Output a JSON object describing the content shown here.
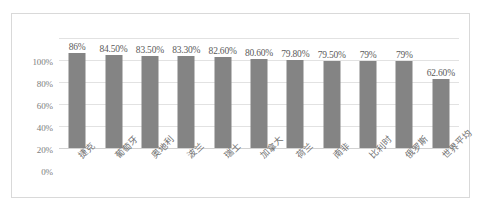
{
  "chart_data": {
    "type": "bar",
    "title": "",
    "subtitle": "",
    "xlabel": "",
    "ylabel": "",
    "ylim": [
      0,
      100
    ],
    "grid": true,
    "legend": false,
    "legend_position": "none",
    "bar_color": "#848484",
    "gridline_color": "#e2e2e2",
    "axis_text_color": "#7d7d7d",
    "categories": [
      "捷克",
      "葡萄牙",
      "奥地利",
      "波兰",
      "瑞士",
      "加拿大",
      "荷兰",
      "南非",
      "比利时",
      "俄罗斯",
      "世界平均"
    ],
    "values": [
      86,
      84.5,
      83.5,
      83.3,
      82.6,
      80.6,
      79.8,
      79.5,
      79,
      79,
      62.6
    ],
    "data_labels": [
      "86%",
      "84.50%",
      "83.50%",
      "83.30%",
      "82.60%",
      "80.60%",
      "79.80%",
      "79.50%",
      "79%",
      "79%",
      "62.60%"
    ],
    "y_ticks": [
      100,
      80,
      60,
      40,
      20,
      0
    ],
    "y_tick_labels": [
      "100%",
      "80%",
      "60%",
      "40%",
      "20%",
      "0%"
    ]
  }
}
